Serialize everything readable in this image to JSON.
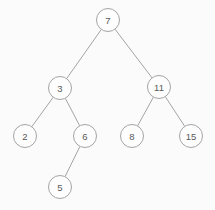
{
  "diagram": {
    "type": "binary-search-tree",
    "background_color": "#fbfbfb",
    "node_fill_color": "#fdfdfd",
    "node_stroke_color": "#9a9a9a",
    "edge_color": "#9a9a9a",
    "label_color": "#5a5a5a",
    "node_radius": 11.5,
    "nodes": [
      {
        "id": "n7",
        "label": "7",
        "x": 108,
        "y": 20,
        "depth": 0,
        "parent": null,
        "side": "root"
      },
      {
        "id": "n3",
        "label": "3",
        "x": 60,
        "y": 88,
        "depth": 1,
        "parent": "n7",
        "side": "left"
      },
      {
        "id": "n11",
        "label": "11",
        "x": 159,
        "y": 87,
        "depth": 1,
        "parent": "n7",
        "side": "right"
      },
      {
        "id": "n2",
        "label": "2",
        "x": 25,
        "y": 136,
        "depth": 2,
        "parent": "n3",
        "side": "left"
      },
      {
        "id": "n6",
        "label": "6",
        "x": 85,
        "y": 136,
        "depth": 2,
        "parent": "n3",
        "side": "right"
      },
      {
        "id": "n8",
        "label": "8",
        "x": 132,
        "y": 136,
        "depth": 2,
        "parent": "n11",
        "side": "left"
      },
      {
        "id": "n15",
        "label": "15",
        "x": 191,
        "y": 136,
        "depth": 2,
        "parent": "n11",
        "side": "right"
      },
      {
        "id": "n5",
        "label": "5",
        "x": 60,
        "y": 187,
        "depth": 3,
        "parent": "n6",
        "side": "left"
      }
    ],
    "edges": [
      {
        "id": "e-7-3",
        "from": "n7",
        "to": "n3"
      },
      {
        "id": "e-7-11",
        "from": "n7",
        "to": "n11"
      },
      {
        "id": "e-3-2",
        "from": "n3",
        "to": "n2"
      },
      {
        "id": "e-3-6",
        "from": "n3",
        "to": "n6"
      },
      {
        "id": "e-11-8",
        "from": "n11",
        "to": "n8"
      },
      {
        "id": "e-11-15",
        "from": "n11",
        "to": "n15"
      },
      {
        "id": "e-6-5",
        "from": "n6",
        "to": "n5"
      }
    ]
  }
}
